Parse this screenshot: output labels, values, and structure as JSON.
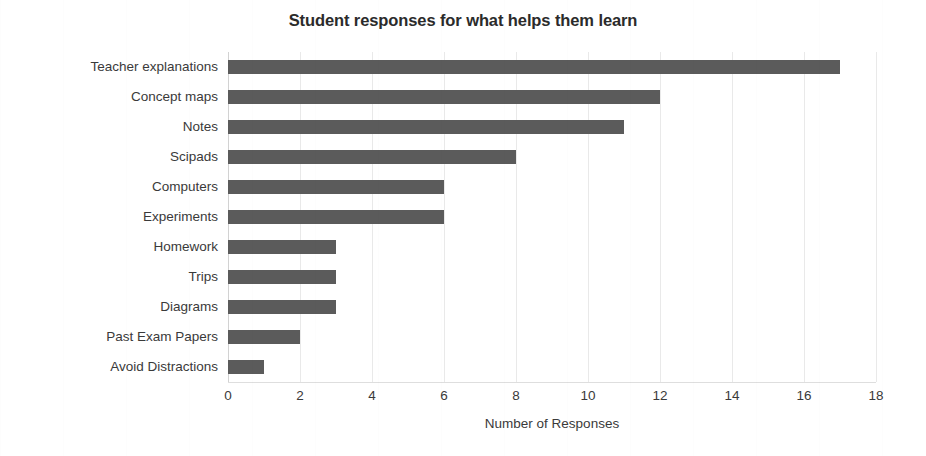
{
  "chart_data": {
    "type": "bar",
    "orientation": "horizontal",
    "title": "Student responses for what helps them learn",
    "xlabel": "Number of Responses",
    "ylabel": "",
    "categories": [
      "Teacher explanations",
      "Concept maps",
      "Notes",
      "Scipads",
      "Computers",
      "Experiments",
      "Homework",
      "Trips",
      "Diagrams",
      "Past Exam Papers",
      "Avoid Distractions"
    ],
    "values": [
      17,
      12,
      11,
      8,
      6,
      6,
      3,
      3,
      3,
      2,
      1
    ],
    "xlim": [
      0,
      18
    ],
    "xticks": [
      0,
      2,
      4,
      6,
      8,
      10,
      12,
      14,
      16,
      18
    ],
    "xtick_labels": [
      "0",
      "2",
      "4",
      "6",
      "8",
      "10",
      "12",
      "14",
      "16",
      "18"
    ],
    "grid": "vertical-only",
    "legend": "none",
    "bar_color": "#5b5b5b",
    "gridline_color": "#e9e9e9",
    "background_color": "#ffffff",
    "text_color": "#3a3a3a"
  }
}
